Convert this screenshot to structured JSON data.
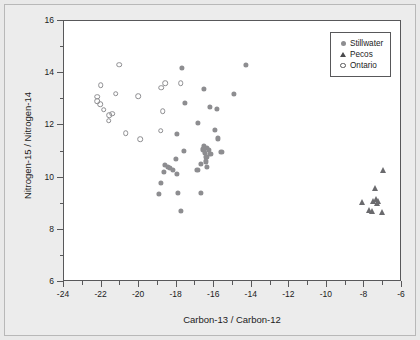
{
  "chart_data": {
    "type": "scatter",
    "title": "",
    "xlabel": "Carbon-13 / Carbon-12",
    "ylabel": "Nitrogen-15 / Nitrogen-14",
    "xlim": [
      -24,
      -6
    ],
    "ylim": [
      6,
      16
    ],
    "xticks": [
      -24,
      -22,
      -20,
      -18,
      -16,
      -14,
      -12,
      -10,
      -8,
      -6
    ],
    "xticklabels": [
      "-24",
      "-22",
      "-20",
      "-18",
      "-16",
      "-14",
      "-12",
      "-10",
      "-8",
      "-6"
    ],
    "xminorticks": [
      -23,
      -21,
      -19,
      -17,
      -15,
      -13,
      -11,
      -9,
      -7
    ],
    "yticks": [
      6,
      8,
      10,
      12,
      14,
      16
    ],
    "yticklabels": [
      "6",
      "8",
      "10",
      "12",
      "14",
      "16"
    ],
    "yminorticks": [
      7,
      9,
      11,
      13,
      15
    ],
    "grid": false,
    "legend_position": "top-right",
    "series": [
      {
        "name": "Stillwater",
        "marker": "filled-circle",
        "color": "#8d8d90",
        "points": [
          [
            -17.72,
            14.21
          ],
          [
            -14.32,
            14.32
          ],
          [
            -16.55,
            13.4
          ],
          [
            -14.95,
            13.2
          ],
          [
            -17.55,
            12.87
          ],
          [
            -16.22,
            12.72
          ],
          [
            -15.85,
            12.64
          ],
          [
            -16.86,
            12.08
          ],
          [
            -15.95,
            11.83
          ],
          [
            -15.8,
            11.5
          ],
          [
            -17.6,
            11.03
          ],
          [
            -16.55,
            11.22
          ],
          [
            -16.4,
            11.13
          ],
          [
            -16.3,
            11.05
          ],
          [
            -16.48,
            10.95
          ],
          [
            -16.58,
            11.08
          ],
          [
            -16.2,
            10.92
          ],
          [
            -15.62,
            11.0
          ],
          [
            -16.42,
            10.78
          ],
          [
            -16.45,
            10.62
          ],
          [
            -16.72,
            10.52
          ],
          [
            -16.38,
            10.4
          ],
          [
            -16.9,
            10.3
          ],
          [
            -18.05,
            10.72
          ],
          [
            -18.62,
            10.48
          ],
          [
            -18.48,
            10.4
          ],
          [
            -18.35,
            10.38
          ],
          [
            -18.22,
            10.3
          ],
          [
            -18.68,
            10.22
          ],
          [
            -17.98,
            10.15
          ],
          [
            -18.85,
            9.8
          ],
          [
            -18.95,
            9.38
          ],
          [
            -17.95,
            9.42
          ],
          [
            -16.7,
            9.4
          ],
          [
            -17.78,
            8.72
          ],
          [
            -17.98,
            11.68
          ]
        ]
      },
      {
        "name": "Pecos",
        "marker": "filled-triangle",
        "color": "#6a6a6d",
        "points": [
          [
            -7.02,
            10.28
          ],
          [
            -7.42,
            9.6
          ],
          [
            -8.12,
            9.05
          ],
          [
            -7.52,
            9.12
          ],
          [
            -7.4,
            9.18
          ],
          [
            -7.3,
            9.12
          ],
          [
            -7.35,
            9.02
          ],
          [
            -7.78,
            8.75
          ],
          [
            -7.62,
            8.72
          ],
          [
            -7.08,
            8.68
          ]
        ]
      },
      {
        "name": "Ontario",
        "marker": "open-circle",
        "color": "#8d8d90",
        "points": [
          [
            -21.05,
            14.32
          ],
          [
            -22.05,
            13.55
          ],
          [
            -21.25,
            13.22
          ],
          [
            -20.05,
            13.12
          ],
          [
            -22.22,
            13.1
          ],
          [
            -22.22,
            12.92
          ],
          [
            -22.08,
            12.82
          ],
          [
            -21.88,
            12.6
          ],
          [
            -21.42,
            12.45
          ],
          [
            -21.58,
            12.38
          ],
          [
            -21.62,
            12.18
          ],
          [
            -20.72,
            11.7
          ],
          [
            -19.95,
            11.48
          ],
          [
            -18.82,
            13.45
          ],
          [
            -18.62,
            13.62
          ],
          [
            -17.78,
            13.62
          ],
          [
            -18.75,
            12.55
          ],
          [
            -18.85,
            11.8
          ]
        ]
      }
    ]
  },
  "legend": {
    "items": [
      {
        "label": "Stillwater",
        "marker": "filled-circle"
      },
      {
        "label": "Pecos",
        "marker": "filled-triangle"
      },
      {
        "label": "Ontario",
        "marker": "open-circle"
      }
    ]
  }
}
